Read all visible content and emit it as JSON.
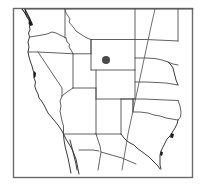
{
  "figure": {
    "type": "locator-map",
    "width": 203,
    "height": 194,
    "background_color": "#ffffff"
  },
  "frame": {
    "name": "map-border-frame",
    "x": 13,
    "y": 8,
    "width": 180,
    "height": 170,
    "stroke_color": "#6b6b6b"
  },
  "marker": {
    "label": "",
    "shape": "filled-circle",
    "color": "#4a4a4a",
    "center_x": 106,
    "center_y": 60,
    "radius": 4,
    "located_in": "Wyoming"
  },
  "map_features": {
    "region": "Western United States",
    "states_shown": [
      "Washington",
      "Oregon",
      "California",
      "Idaho",
      "Nevada",
      "Utah",
      "Arizona",
      "Montana",
      "Wyoming",
      "Colorado",
      "New Mexico",
      "North Dakota",
      "South Dakota",
      "Nebraska",
      "Kansas",
      "Oklahoma",
      "Texas"
    ],
    "coastlines": [
      "Pacific Coast",
      "Gulf of Mexico Coast"
    ],
    "inset_details": [
      "Puget Sound",
      "San Francisco Bay",
      "Gulf Coast bays"
    ],
    "line_overlay": "meridian-line"
  },
  "colors": {
    "state_border": "#4f4f4f",
    "coastline": "#3a3a3a",
    "frame": "#6b6b6b",
    "marker": "#4a4a4a",
    "land_fill": "#ffffff"
  }
}
